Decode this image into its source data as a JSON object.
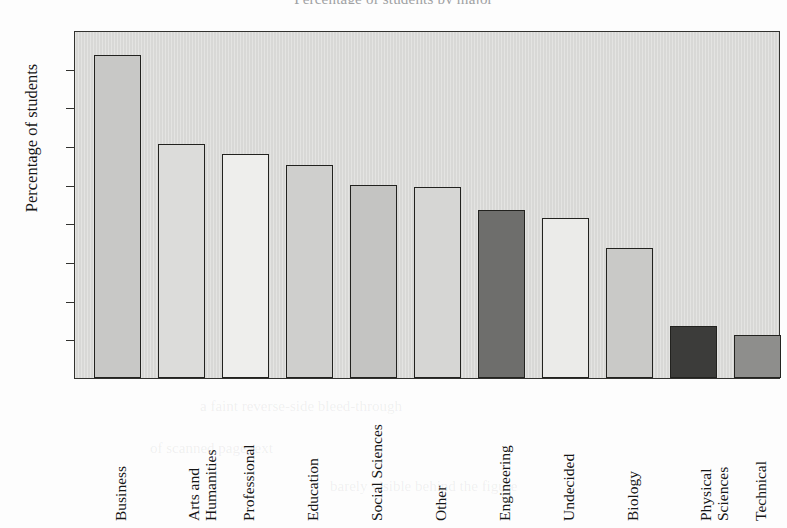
{
  "figure": {
    "title": "Percentage of students by major",
    "background_color": "#fdfdfd",
    "plot_background_color": "#d8d8d6",
    "frame_color": "#32322f"
  },
  "chart_data": {
    "type": "bar",
    "title": "Percentage of students by major",
    "xlabel": "",
    "ylabel": "Percentage of students",
    "ylim": [
      0,
      18
    ],
    "ytick_labels": [
      "0",
      "2",
      "4",
      "6",
      "8",
      "10",
      "12",
      "14",
      "16",
      "18"
    ],
    "ytick_values": [
      0,
      2,
      4,
      6,
      8,
      10,
      12,
      14,
      16,
      18
    ],
    "grid": false,
    "legend": "none",
    "categories": [
      "Business",
      "Arts and Humanities",
      "Professional",
      "Education",
      "Social Sciences",
      "Other",
      "Engineering",
      "Undecided",
      "Biology",
      "Physical Sciences",
      "Technical"
    ],
    "category_lines": [
      [
        "Business"
      ],
      [
        "Arts and",
        "Humanities"
      ],
      [
        "Professional"
      ],
      [
        "Education"
      ],
      [
        "Social Sciences"
      ],
      [
        "Other"
      ],
      [
        "Engineering"
      ],
      [
        "Undecided"
      ],
      [
        "Biology"
      ],
      [
        "Physical",
        "Sciences"
      ],
      [
        "Technical"
      ]
    ],
    "values": [
      16.7,
      12.1,
      11.6,
      11.0,
      10.0,
      9.9,
      8.7,
      8.3,
      6.7,
      2.7,
      2.2
    ],
    "bar_colors": [
      "#c8c8c6",
      "#dcdcda",
      "#eeeeec",
      "#cfcfcd",
      "#c4c4c2",
      "#d6d6d4",
      "#6e6e6c",
      "#ebebe9",
      "#c9c9c7",
      "#3c3c3a",
      "#8e8e8c"
    ],
    "bar_edge_color": "#22221f"
  },
  "ghost_text": {
    "line1": "a faint reverse-side bleed-through",
    "line2": "of scanned page text",
    "line3": "barely visible behind the figure"
  }
}
